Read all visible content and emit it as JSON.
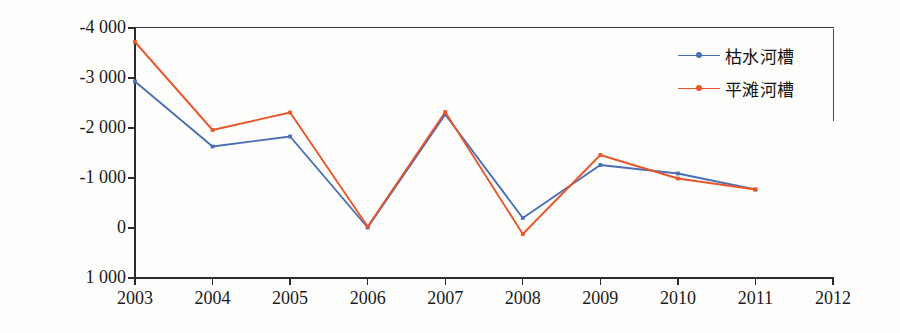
{
  "chart_data": {
    "type": "line",
    "title": "",
    "xlabel": "",
    "ylabel": "冲淤量(万 m³)",
    "ylabel_unit_sup": "3",
    "ylabel_base": "冲淤量(万 m",
    "ylabel_tail": ")",
    "x": [
      2003,
      2004,
      2005,
      2006,
      2007,
      2008,
      2009,
      2010,
      2011
    ],
    "categories": [
      "2003",
      "2004",
      "2005",
      "2006",
      "2007",
      "2008",
      "2009",
      "2010",
      "2011"
    ],
    "xtick_labels": [
      "2003",
      "2004",
      "2005",
      "2006",
      "2007",
      "2008",
      "2009",
      "2010",
      "2011",
      "2012"
    ],
    "xlim": [
      2003,
      2012
    ],
    "ytick_labels": [
      "-4 000",
      "-3 000",
      "-2 000",
      "-1 000",
      "0",
      "1 000"
    ],
    "ytick_values": [
      -4000,
      -3000,
      -2000,
      -1000,
      0,
      1000
    ],
    "ylim": [
      -4000,
      1000
    ],
    "y_axis_inverted": true,
    "grid": false,
    "legend_position": "top-right",
    "series": [
      {
        "name": "枯水河槽",
        "color": "#4a6fb5",
        "marker": "dot",
        "values": [
          -2930,
          -1630,
          -1830,
          -10,
          -2270,
          -200,
          -1260,
          -1090,
          -770
        ]
      },
      {
        "name": "平滩河槽",
        "color": "#e8562b",
        "marker": "dot",
        "values": [
          -3720,
          -1960,
          -2310,
          -30,
          -2320,
          120,
          -1460,
          -990,
          -770
        ]
      }
    ]
  },
  "legend": {
    "items": [
      {
        "label": "枯水河槽",
        "color": "#4a6fb5"
      },
      {
        "label": "平滩河槽",
        "color": "#e8562b"
      }
    ]
  },
  "colors": {
    "series_blue": "#4a6fb5",
    "series_orange": "#e8562b",
    "axis": "#2b2b2b",
    "text": "#1b1b1b",
    "background": "#fdfdfc"
  }
}
